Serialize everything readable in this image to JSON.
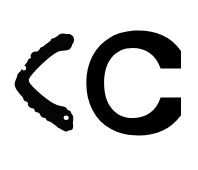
{
  "image": {
    "width": 198,
    "height": 170,
    "background_color": "#ffffff",
    "ink_color": "#000000",
    "description": "Two black glyphs on a plain white background"
  },
  "glyphs": [
    {
      "name": "chevron-left-glyph",
      "character": "<",
      "style": "hand-drawn brush stroke, irregular rough edges, blunt terminals",
      "color": "#050505",
      "bounds": {
        "x": 15,
        "y": 34,
        "width": 58,
        "height": 97
      },
      "vertex": {
        "x": 19,
        "y": 83
      }
    },
    {
      "name": "letter-c-glyph",
      "character": "C",
      "style": "bold sans-serif, flat vertical cut terminals",
      "color": "#000000",
      "bounds": {
        "x": 104,
        "y": 31,
        "width": 77,
        "height": 104
      },
      "stroke_width": 22
    }
  ],
  "reading": {
    "text": "<C",
    "label_left": "less-than sign",
    "label_right": "capital letter C"
  }
}
